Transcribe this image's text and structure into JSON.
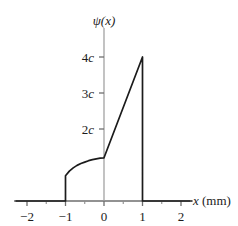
{
  "figure": {
    "background_color": "#ffffff",
    "line_color": "#1b1b1b",
    "axis_color": "#6e6e6e"
  },
  "axes": {
    "y_axis_title": "ψ(x)",
    "x_axis_title_symbol": "x",
    "x_axis_title_unit": "(mm)"
  },
  "chart_data": {
    "type": "line",
    "title": "",
    "subtitle": "",
    "xlabel": "x (mm)",
    "ylabel": "ψ(x)",
    "xlim": [
      -2.3,
      2.3
    ],
    "ylim": [
      0,
      4.45
    ],
    "grid": false,
    "legend": null,
    "x_ticks": [
      -2,
      -1,
      0,
      1,
      2
    ],
    "x_tick_labels": [
      "−2",
      "−1",
      "0",
      "1",
      "2"
    ],
    "x_minor_ticks": [
      -1.5,
      -0.5,
      0.5,
      1.5
    ],
    "y_ticks": [
      2,
      3,
      4
    ],
    "y_tick_labels": [
      "2c",
      "3c",
      "4c"
    ],
    "y_tick_label_parts": [
      {
        "number": "2",
        "symbol": "c"
      },
      {
        "number": "3",
        "symbol": "c"
      },
      {
        "number": "4",
        "symbol": "c"
      }
    ],
    "series": [
      {
        "name": "psi(x)",
        "points": [
          {
            "x": -2.3,
            "y": 0
          },
          {
            "x": -1.0,
            "y": 0
          },
          {
            "x": -1.0,
            "y": 0.7
          },
          {
            "x": -0.9,
            "y": 0.83
          },
          {
            "x": -0.8,
            "y": 0.92
          },
          {
            "x": -0.7,
            "y": 0.99
          },
          {
            "x": -0.6,
            "y": 1.04
          },
          {
            "x": -0.5,
            "y": 1.08
          },
          {
            "x": -0.4,
            "y": 1.12
          },
          {
            "x": -0.3,
            "y": 1.15
          },
          {
            "x": -0.2,
            "y": 1.17
          },
          {
            "x": -0.1,
            "y": 1.19
          },
          {
            "x": 0.0,
            "y": 1.2
          },
          {
            "x": 1.0,
            "y": 4.0
          },
          {
            "x": 1.0,
            "y": 0
          },
          {
            "x": 2.3,
            "y": 0
          }
        ]
      }
    ],
    "annotations": [
      {
        "label": "peak",
        "x": 1,
        "y": 4
      },
      {
        "label": "discontinuity",
        "x": -1,
        "y": 0.7
      },
      {
        "label": "kink",
        "x": 0,
        "y": 1.2
      }
    ]
  }
}
